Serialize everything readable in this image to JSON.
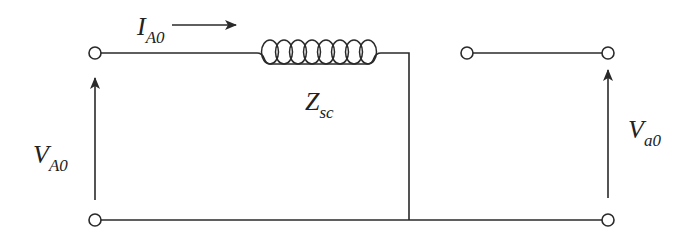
{
  "diagram": {
    "type": "circuit",
    "labels": {
      "current": {
        "main": "I",
        "sub": "A0"
      },
      "impedance": {
        "main": "Z",
        "sub": "sc"
      },
      "input_voltage": {
        "main": "V",
        "sub": "A0"
      },
      "output_voltage": {
        "main": "V",
        "sub": "a0"
      }
    },
    "components": [
      {
        "id": "impedance",
        "kind": "inductor",
        "label": "Z_sc"
      },
      {
        "id": "input-terminals",
        "kind": "terminal-pair",
        "label": "V_A0"
      },
      {
        "id": "output-terminals",
        "kind": "terminal-pair",
        "label": "V_a0"
      }
    ],
    "colors": {
      "line": "#2a2a2a",
      "background": "#ffffff"
    }
  }
}
